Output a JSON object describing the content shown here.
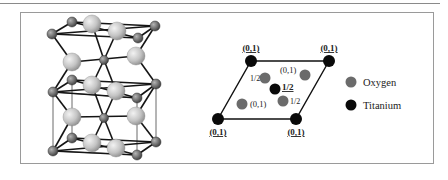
{
  "figure": {
    "panels": [
      {
        "id": "crystal-structure",
        "description": "3D ball-and-stick rutile TiO2 unit cell"
      },
      {
        "id": "projection",
        "description": "2D projection of the unit cell with fractional heights"
      }
    ],
    "projection": {
      "corner_labels": [
        "(0,1)",
        "(0,1)",
        "(0,1)",
        "(0,1)"
      ],
      "center_label": "1/2",
      "oxygen_labels": [
        "1/2",
        "(0,1)",
        "(0,1)",
        "1/2"
      ]
    },
    "legend": {
      "items": [
        {
          "label": "Oxygen",
          "color": "#6b6b6b"
        },
        {
          "label": "Titanium",
          "color": "#0a0a0a"
        }
      ]
    }
  },
  "colors": {
    "frame": "#9a9a9a",
    "oxygen_3d": "#c8c8c8",
    "titanium_3d": "#707070",
    "bond": "#1a1a1a"
  }
}
